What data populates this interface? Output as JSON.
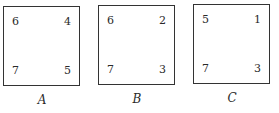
{
  "squares": [
    {
      "label": "A",
      "top_left": "6",
      "top_right": "4",
      "bottom_left": "7",
      "bottom_right": "5"
    },
    {
      "label": "B",
      "top_left": "6",
      "top_right": "2",
      "bottom_left": "7",
      "bottom_right": "3"
    },
    {
      "label": "C",
      "top_left": "5",
      "top_right": "1",
      "bottom_left": "7",
      "bottom_right": "3"
    }
  ]
}
